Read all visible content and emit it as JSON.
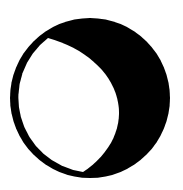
{
  "icon": {
    "name": "moon-phase-icon",
    "phase": "gibbous",
    "lit_side": "left",
    "dark_color": "#000000",
    "lit_color": "#ffffff",
    "background_color": "#ffffff"
  }
}
